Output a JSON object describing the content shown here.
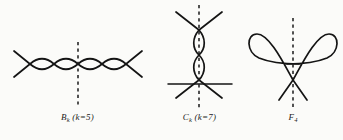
{
  "figure": {
    "background_color": "#fbfbf9",
    "ink_color": "#141414",
    "panels": [
      {
        "id": "bk",
        "name": "B_k singularity diagram",
        "caption_main": "B",
        "caption_sub": "k",
        "caption_paren": " (k=5)",
        "caption_full": "Bₖ (k=5)",
        "shape": "two sinusoidal branches crossing repeatedly forming a horizontal chain of four lens shapes with straight tails at both ends",
        "axis": "vertical dashed symmetry axis through the centre crossing",
        "lens_count": 4,
        "k_value": 5
      },
      {
        "id": "ck",
        "name": "C_k singularity diagram",
        "caption_main": "C",
        "caption_sub": "k",
        "caption_paren": " (k=7)",
        "caption_full": "Cₖ (k=7)",
        "shape": "vertical chain of two lens shapes between an upper X crossing and a lower X crossing, with a horizontal line through the lower crossing",
        "axis": "vertical dashed symmetry axis through the chain",
        "lens_count": 2,
        "k_value": 7
      },
      {
        "id": "f4",
        "name": "F_4 singularity diagram",
        "caption_main": "F",
        "caption_sub": "4",
        "caption_paren": "",
        "caption_full": "F₄",
        "shape": "two symmetric loops opening left and right above a horizontal line, meeting at a lower crossing point with two downward tails",
        "axis": "vertical dashed symmetry axis through the crossing",
        "loop_count": 2
      }
    ]
  }
}
